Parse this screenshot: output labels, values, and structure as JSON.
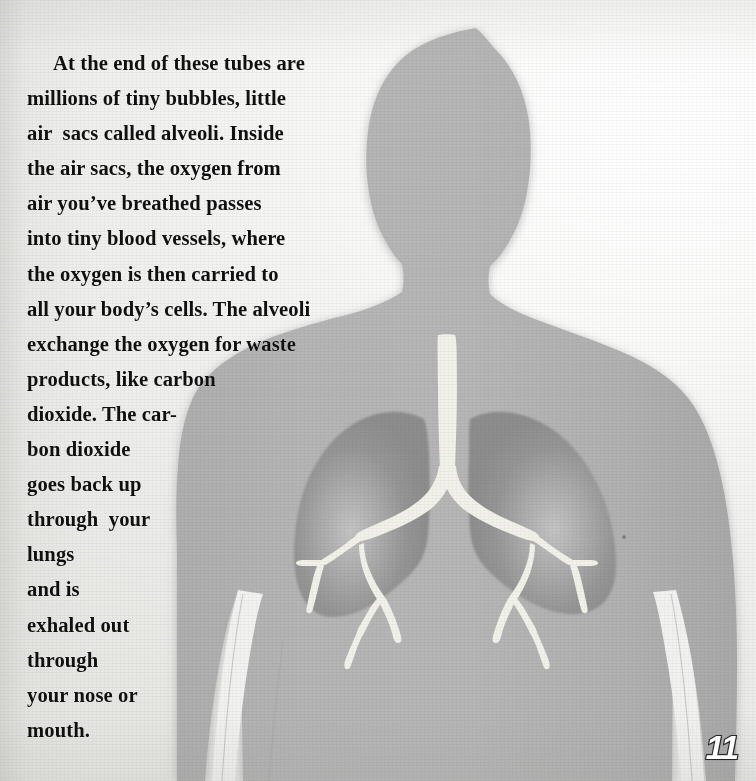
{
  "page": {
    "number": "11",
    "background_color": "#ececea",
    "paper_tint": "#f4f4f2"
  },
  "body_text": {
    "full_text": "At the end of these tubes are millions of tiny bubbles, little air  sacs called alveoli. Inside the air sacs, the oxygen from air you've breathed passes into tiny blood vessels, where the oxygen is then carried to all your body's cells. The alveoli exchange the oxygen for waste products, like carbon dioxide. The car-bon dioxide goes back up through  your lungs and is exhaled out through your nose or mouth.",
    "lines": [
      "At the end of these tubes are",
      "millions of tiny bubbles, little",
      "air  sacs called alveoli. Inside",
      "the air sacs, the oxygen from",
      "air you’ve breathed passes",
      "into tiny blood vessels, where",
      "the oxygen is then carried to",
      "all your body’s cells. The alveoli",
      "exchange the oxygen for waste",
      "products, like carbon",
      "dioxide. The car-",
      "bon dioxide",
      "goes back up",
      "through  your",
      "lungs",
      "and is",
      "exhaled out",
      "through",
      "your nose or",
      "mouth."
    ],
    "text_color": "#101010"
  },
  "illustration": {
    "name": "human-torso-with-lungs",
    "description": "Gray silhouette of a human head, neck, shoulders, torso and arms with lungs, trachea and bronchial tree shown inside the chest",
    "parts": [
      {
        "name": "body-silhouette",
        "color": "#b3b3b3"
      },
      {
        "name": "left-lung",
        "color": "#949494"
      },
      {
        "name": "right-lung",
        "color": "#949494"
      },
      {
        "name": "trachea",
        "color": "#f2f1ea"
      },
      {
        "name": "bronchial-tree",
        "color": "#f2f1ea"
      }
    ],
    "colors": {
      "body": "#b3b3b3",
      "body_shadow": "#a3a3a3",
      "lung": "#949494",
      "lung_glow": "#bdbdbd",
      "airway": "#f2f1ea"
    }
  }
}
